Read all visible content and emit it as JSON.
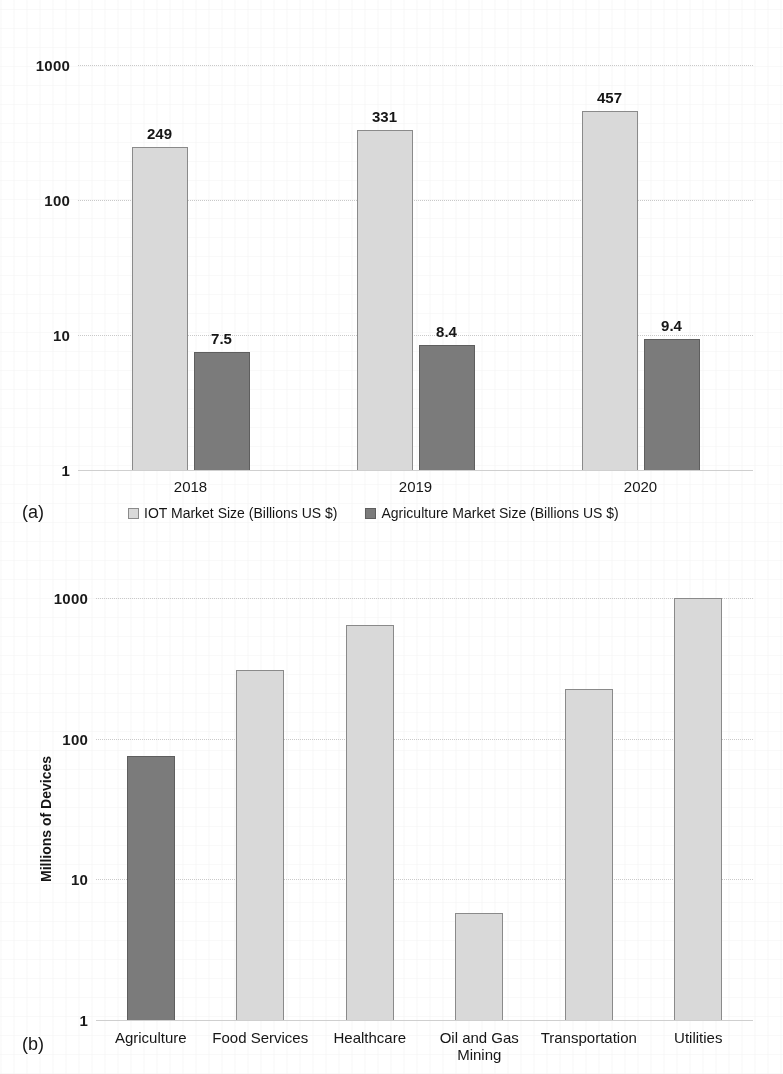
{
  "figure": {
    "panel_a_caption": "(a)",
    "panel_b_caption": "(b)"
  },
  "chart_data": [
    {
      "panel": "(a)",
      "type": "bar",
      "title": "",
      "xlabel": "",
      "ylabel": "",
      "scale": "log",
      "ylim": [
        1,
        1000
      ],
      "yticks": [
        "1",
        "10",
        "100",
        "1000"
      ],
      "ytick_values": [
        1,
        10,
        100,
        1000
      ],
      "grid": true,
      "legend_position": "bottom",
      "categories": [
        "2018",
        "2019",
        "2020"
      ],
      "series": [
        {
          "name": "IOT Market Size  (Billions US $)",
          "color": "#d9d9d9",
          "values": [
            249,
            331,
            457
          ],
          "labels": [
            "249",
            "331",
            "457"
          ]
        },
        {
          "name": "Agriculture Market Size  (Billions US $)",
          "color": "#7b7b7b",
          "values": [
            7.5,
            8.4,
            9.4
          ],
          "labels": [
            "7.5",
            "8.4",
            "9.4"
          ]
        }
      ]
    },
    {
      "panel": "(b)",
      "type": "bar",
      "title": "",
      "xlabel": "",
      "ylabel": "Millions of Devices",
      "scale": "log",
      "ylim": [
        1,
        1000
      ],
      "yticks": [
        "1",
        "10",
        "100",
        "1000"
      ],
      "ytick_values": [
        1,
        10,
        100,
        1000
      ],
      "grid": true,
      "legend_position": "none",
      "categories": [
        "Agriculture",
        "Food Services",
        "Healthcare",
        "Oil and Gas\nMining",
        "Transportation",
        "Utilities"
      ],
      "series": [
        {
          "name": "Millions of Devices",
          "values": [
            75,
            310,
            640,
            5.8,
            225,
            1080
          ],
          "colors": [
            "#7b7b7b",
            "#d9d9d9",
            "#d9d9d9",
            "#d9d9d9",
            "#d9d9d9",
            "#d9d9d9"
          ]
        }
      ]
    }
  ]
}
